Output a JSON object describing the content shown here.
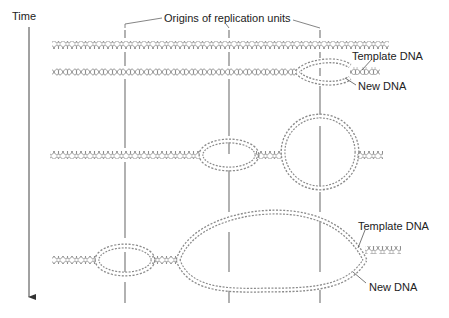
{
  "figure": {
    "time_label": "Time",
    "origins_label": "Origins of replication units",
    "labels": {
      "template_dna_upper": "Template DNA",
      "new_dna_upper": "New DNA",
      "template_dna_lower": "Template DNA",
      "new_dna_lower": "New DNA"
    },
    "colors": {
      "dna": "#8a8a8a",
      "line": "#777777",
      "text": "#222222"
    },
    "origins_x": [
      125,
      229,
      320
    ],
    "stages": 4
  }
}
